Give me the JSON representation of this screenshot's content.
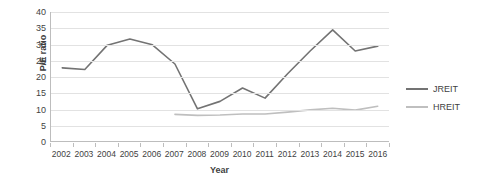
{
  "chart_data": {
    "type": "line",
    "title": "",
    "xlabel": "Year",
    "ylabel": "P/E ratio",
    "categories": [
      "2002",
      "2003",
      "2004",
      "2005",
      "2006",
      "2007",
      "2008",
      "2009",
      "2010",
      "2011",
      "2012",
      "2013",
      "2014",
      "2015",
      "2016"
    ],
    "ylim": [
      0,
      40
    ],
    "ytick_step": 5,
    "yticks": [
      "40",
      "35",
      "30",
      "25",
      "20",
      "15",
      "10",
      "5",
      "0"
    ],
    "grid": "horizontal",
    "legend_position": "right",
    "series": [
      {
        "name": "JREIT",
        "color": "#737373",
        "values": [
          22.8,
          22.3,
          29.8,
          31.7,
          29.9,
          24.0,
          10.2,
          12.5,
          16.6,
          13.5,
          21.0,
          28.0,
          34.5,
          28.0,
          29.5
        ]
      },
      {
        "name": "HREIT",
        "color": "#bfbfbf",
        "values": [
          null,
          null,
          null,
          null,
          null,
          8.5,
          8.2,
          8.3,
          8.6,
          8.6,
          9.2,
          9.9,
          10.4,
          9.8,
          11.0
        ]
      }
    ]
  },
  "axis": {
    "y_title": "P/E ratio",
    "x_title": "Year"
  },
  "legend": {
    "items": [
      {
        "label": "JREIT",
        "color": "#737373"
      },
      {
        "label": "HREIT",
        "color": "#bfbfbf"
      }
    ]
  },
  "colors": {
    "gridline": "#e2e2e2",
    "axis": "#bdbdbd",
    "text": "#3f3f3f",
    "background": "#ffffff"
  }
}
